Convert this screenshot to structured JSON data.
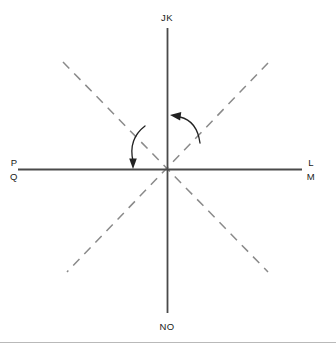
{
  "figure": {
    "background_color": "#ffffff",
    "width": 336,
    "height": 353
  },
  "geometry": {
    "origin": {
      "x": 167,
      "y": 169
    },
    "solid_line_color": "#4a4a4a",
    "dashed_line_color": "#8a8a8a",
    "arc_color": "#222222",
    "divider_color": "#b9b9b9",
    "dash_pattern": "9,7"
  },
  "labels": {
    "top": "JK",
    "bottom": "NO",
    "left_upper": "P",
    "left_lower": "Q",
    "right_upper": "L",
    "right_lower": "M"
  },
  "lines": {
    "vertical": {
      "name": "vertical-solid-line",
      "x": 167,
      "y_start": 28,
      "y_end": 313
    },
    "horizontal": {
      "name": "horizontal-solid-line",
      "y": 169,
      "x_start": 18,
      "x_end": 302
    },
    "dashed_nw_se": {
      "name": "dashed-line-nw-se",
      "x1": 63,
      "y1": 62,
      "x2": 268,
      "y2": 272
    },
    "dashed_ne_sw": {
      "name": "dashed-line-ne-sw",
      "x1": 268,
      "y1": 63,
      "x2": 67,
      "y2": 272
    }
  },
  "arcs": {
    "left": {
      "name": "angle-arc-left",
      "description": "arc from NW dashed ray to horizontal axis, arrowhead pointing down",
      "path": "M 145 126 Q 129 139 133 160",
      "arrow_tip": {
        "x": 133,
        "y": 166
      }
    },
    "right": {
      "name": "angle-arc-right",
      "description": "arc from NE dashed ray to vertical axis, arrowhead pointing up-left",
      "path": "M 199 142 Q 196 122 179 117",
      "arrow_tip": {
        "x": 172,
        "y": 116
      }
    }
  },
  "divider": {
    "name": "bottom-divider",
    "y": 342
  }
}
